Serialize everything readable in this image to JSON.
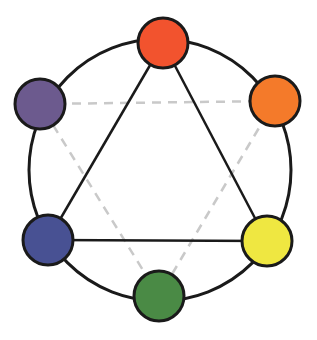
{
  "diagram": {
    "type": "color-wheel-triad",
    "ring": {
      "cx": 160,
      "cy": 170,
      "r": 131,
      "stroke": "#1a1a1a",
      "stroke_width": 3
    },
    "node_radius": 25,
    "node_stroke": "#1a1a1a",
    "nodes": [
      {
        "id": "red",
        "label": "red",
        "cx": 163,
        "cy": 43,
        "fill": "#f2532e"
      },
      {
        "id": "orange",
        "label": "orange",
        "cx": 275,
        "cy": 101,
        "fill": "#f47a2a"
      },
      {
        "id": "yellow",
        "label": "yellow",
        "cx": 267,
        "cy": 241,
        "fill": "#efe741"
      },
      {
        "id": "green",
        "label": "green",
        "cx": 159,
        "cy": 296,
        "fill": "#4a8a45"
      },
      {
        "id": "blue",
        "label": "blue",
        "cx": 48,
        "cy": 240,
        "fill": "#485193"
      },
      {
        "id": "purple",
        "label": "purple",
        "cx": 40,
        "cy": 104,
        "fill": "#6c5a8e"
      }
    ],
    "primary_triangle": {
      "style": "solid",
      "color": "#1a1a1a",
      "vertices": [
        "red",
        "yellow",
        "blue"
      ]
    },
    "secondary_triangle": {
      "style": "dashed",
      "color": "#c9c9c9",
      "vertices": [
        "purple",
        "orange",
        "green"
      ]
    }
  }
}
